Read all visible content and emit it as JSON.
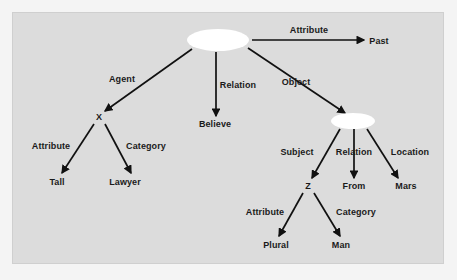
{
  "diagram": {
    "background_color": "#dcdcdc",
    "page_color": "#f4f4f4",
    "line_color": "#111111",
    "ellipse_fill": "#ffffff",
    "nodes": [
      {
        "id": "root",
        "label": "",
        "shape": "ellipse",
        "x": 218,
        "y": 40,
        "rx": 31,
        "ry": 11
      },
      {
        "id": "past",
        "label": "Past",
        "shape": "text",
        "x": 379,
        "y": 41
      },
      {
        "id": "x",
        "label": "X",
        "shape": "text",
        "x": 99,
        "y": 117
      },
      {
        "id": "believe",
        "label": "Believe",
        "shape": "text",
        "x": 215,
        "y": 124
      },
      {
        "id": "obj",
        "label": "",
        "shape": "ellipse",
        "x": 353,
        "y": 121,
        "rx": 22,
        "ry": 8
      },
      {
        "id": "tall",
        "label": "Tall",
        "shape": "text",
        "x": 57,
        "y": 182
      },
      {
        "id": "lawyer",
        "label": "Lawyer",
        "shape": "text",
        "x": 125,
        "y": 182
      },
      {
        "id": "z",
        "label": "Z",
        "shape": "text",
        "x": 308,
        "y": 186
      },
      {
        "id": "from",
        "label": "From",
        "shape": "text",
        "x": 354,
        "y": 186
      },
      {
        "id": "mars",
        "label": "Mars",
        "shape": "text",
        "x": 406,
        "y": 186
      },
      {
        "id": "plural",
        "label": "Plural",
        "shape": "text",
        "x": 276,
        "y": 245
      },
      {
        "id": "man",
        "label": "Man",
        "shape": "text",
        "x": 341,
        "y": 245
      }
    ],
    "edges": [
      {
        "id": "e-attribute-past",
        "label": "Attribute",
        "from": "root",
        "to": "past",
        "x1": 252,
        "y1": 40,
        "x2": 364,
        "y2": 40,
        "lx": 309,
        "ly": 30
      },
      {
        "id": "e-agent-x",
        "label": "Agent",
        "from": "root",
        "to": "x",
        "x1": 192,
        "y1": 49,
        "x2": 105,
        "y2": 111,
        "lx": 122,
        "ly": 79
      },
      {
        "id": "e-relation-believe",
        "label": "Relation",
        "from": "root",
        "to": "believe",
        "x1": 216,
        "y1": 52,
        "x2": 216,
        "y2": 116,
        "lx": 238,
        "ly": 85
      },
      {
        "id": "e-object-obj",
        "label": "Object",
        "from": "root",
        "to": "obj",
        "x1": 248,
        "y1": 48,
        "x2": 345,
        "y2": 113,
        "lx": 296,
        "ly": 82
      },
      {
        "id": "e-attribute-tall",
        "label": "Attribute",
        "from": "x",
        "to": "tall",
        "x1": 94,
        "y1": 124,
        "x2": 62,
        "y2": 173,
        "lx": 51,
        "ly": 146
      },
      {
        "id": "e-category-lawyer",
        "label": "Category",
        "from": "x",
        "to": "lawyer",
        "x1": 105,
        "y1": 124,
        "x2": 131,
        "y2": 173,
        "lx": 146,
        "ly": 146
      },
      {
        "id": "e-subject-z",
        "label": "Subject",
        "from": "obj",
        "to": "z",
        "x1": 340,
        "y1": 129,
        "x2": 312,
        "y2": 178,
        "lx": 297,
        "ly": 152
      },
      {
        "id": "e-relation-from",
        "label": "Relation",
        "from": "obj",
        "to": "from",
        "x1": 354,
        "y1": 129,
        "x2": 354,
        "y2": 178,
        "lx": 354,
        "ly": 152
      },
      {
        "id": "e-location-mars",
        "label": "Location",
        "from": "obj",
        "to": "mars",
        "x1": 367,
        "y1": 129,
        "x2": 398,
        "y2": 178,
        "lx": 410,
        "ly": 152
      },
      {
        "id": "e-attribute-plural",
        "label": "Attribute",
        "from": "z",
        "to": "plural",
        "x1": 303,
        "y1": 193,
        "x2": 279,
        "y2": 236,
        "lx": 265,
        "ly": 212
      },
      {
        "id": "e-category-man",
        "label": "Category",
        "from": "z",
        "to": "man",
        "x1": 314,
        "y1": 193,
        "x2": 340,
        "y2": 236,
        "lx": 356,
        "ly": 212
      }
    ]
  }
}
